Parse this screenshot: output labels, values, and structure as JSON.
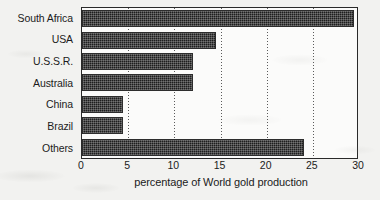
{
  "chart_data": {
    "type": "bar",
    "orientation": "horizontal",
    "title": "",
    "subtitle": "",
    "xlabel": "percentage of World gold production",
    "ylabel": "",
    "categories": [
      "South Africa",
      "USA",
      "U.S.S.R.",
      "Australia",
      "China",
      "Brazil",
      "Others"
    ],
    "values": [
      29.5,
      14.5,
      12,
      12,
      4.4,
      4.4,
      24
    ],
    "xlim": [
      0,
      30
    ],
    "xticks": [
      0,
      5,
      10,
      15,
      20,
      25,
      30
    ],
    "xtick_labels": [
      "0",
      "5",
      "10",
      "15",
      "20",
      "25",
      "30"
    ],
    "grid": "vertical-dotted",
    "legend": "none",
    "bar_color": "#1e1e1e",
    "bar_edge_color": "#2d2d2d",
    "plot_background": "#fbfbfa",
    "axis_color": "#2a2a2a",
    "page_background": "#f2f2f0"
  }
}
